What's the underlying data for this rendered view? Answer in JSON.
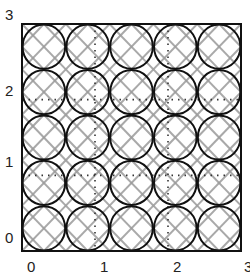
{
  "diagram": {
    "frame": {
      "x_min": 0,
      "x_max": 3,
      "y_min": 0,
      "y_max": 3
    },
    "grid": {
      "rows": 5,
      "cols": 5
    },
    "x_ticks": [
      "0",
      "1",
      "2",
      "3"
    ],
    "y_ticks": [
      "0",
      "1",
      "2",
      "3"
    ],
    "dotted_lines": {
      "vertical_at_x": [
        1,
        2
      ],
      "horizontal_at_y": [
        1,
        2
      ]
    },
    "colors": {
      "frame": "#111111",
      "circles": "#111111",
      "lattice": "#9a9a9a",
      "dotted": "#333333",
      "background": "#ffffff"
    }
  }
}
